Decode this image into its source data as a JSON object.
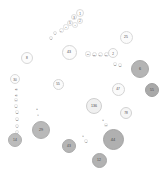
{
  "chart_data": {
    "type": "scatter",
    "title": "",
    "subtitle": "",
    "xlabel": "",
    "ylabel": "",
    "grid": false,
    "legend": null,
    "background": "#ffffff",
    "size_encoding": "circle radius encodes value",
    "color_encoding": "larger values are darker gray, smaller values near white",
    "palette": {
      "darkest": "#9a9a9a",
      "dark": "#a8a8a8",
      "mid": "#bdbdbd",
      "light": "#d6d6d6",
      "lightest": "#f2f2f2",
      "outline": "#cccccc",
      "text": "#4a4a4a"
    },
    "points": [
      {
        "label": "1",
        "x": 80,
        "y": 13,
        "r": 4.0,
        "fill": "#fdfdfd",
        "stroke": "#dcdcdc",
        "font": 3.0
      },
      {
        "label": "3",
        "x": 74,
        "y": 17,
        "r": 3.2,
        "fill": "#fdfdfd",
        "stroke": "#dedede",
        "font": 2.8
      },
      {
        "label": "2",
        "x": 80,
        "y": 21,
        "r": 3.0,
        "fill": "#fdfdfd",
        "stroke": "#dedede",
        "font": 2.6
      },
      {
        "label": "5",
        "x": 70,
        "y": 23,
        "r": 3.0,
        "fill": "#fdfdfd",
        "stroke": "#dedede",
        "font": 2.6
      },
      {
        "label": "4",
        "x": 75,
        "y": 25,
        "r": 2.8,
        "fill": "#fdfdfd",
        "stroke": "#e0e0e0",
        "font": 2.5
      },
      {
        "label": "7",
        "x": 66,
        "y": 27,
        "r": 2.6,
        "fill": "#fdfdfd",
        "stroke": "#e0e0e0",
        "font": 2.4
      },
      {
        "label": "6",
        "x": 61,
        "y": 30,
        "r": 2.5,
        "fill": "#fdfdfd",
        "stroke": "#e2e2e2",
        "font": 2.3
      },
      {
        "label": "9",
        "x": 55,
        "y": 33,
        "r": 2.4,
        "fill": "#fdfdfd",
        "stroke": "#e2e2e2",
        "font": 2.2
      },
      {
        "label": "8",
        "x": 51,
        "y": 38,
        "r": 2.4,
        "fill": "#fdfdfd",
        "stroke": "#e2e2e2",
        "font": 2.2
      },
      {
        "label": "25",
        "x": 126,
        "y": 37,
        "r": 6.5,
        "fill": "#fbfbfb",
        "stroke": "#d9d9d9",
        "font": 3.4
      },
      {
        "label": "43",
        "x": 69,
        "y": 52,
        "r": 7.5,
        "fill": "#fcfcfc",
        "stroke": "#d5d5d5",
        "font": 3.6
      },
      {
        "label": "16",
        "x": 88,
        "y": 54,
        "r": 2.6,
        "fill": "#fdfdfd",
        "stroke": "#e0e0e0",
        "font": 2.4
      },
      {
        "label": "12",
        "x": 94,
        "y": 54,
        "r": 2.5,
        "fill": "#fdfdfd",
        "stroke": "#e0e0e0",
        "font": 2.3
      },
      {
        "label": "14",
        "x": 100,
        "y": 54,
        "r": 2.5,
        "fill": "#fdfdfd",
        "stroke": "#e0e0e0",
        "font": 2.3
      },
      {
        "label": "17",
        "x": 106,
        "y": 54,
        "r": 2.5,
        "fill": "#fdfdfd",
        "stroke": "#e0e0e0",
        "font": 2.3
      },
      {
        "label": "2",
        "x": 113,
        "y": 53,
        "r": 5.0,
        "fill": "#fcfcfc",
        "stroke": "#d8d8d8",
        "font": 3.0
      },
      {
        "label": "8",
        "x": 27,
        "y": 58,
        "r": 6.0,
        "fill": "#fcfcfc",
        "stroke": "#d8d8d8",
        "font": 3.2
      },
      {
        "label": "11",
        "x": 115,
        "y": 64,
        "r": 1.8,
        "fill": "#fdfdfd",
        "stroke": "#e4e4e4",
        "font": 2.0
      },
      {
        "label": "13",
        "x": 120,
        "y": 65,
        "r": 1.8,
        "fill": "#fdfdfd",
        "stroke": "#e4e4e4",
        "font": 2.0
      },
      {
        "label": "6",
        "x": 140,
        "y": 69,
        "r": 9.0,
        "fill": "#b4b4b4",
        "stroke": "#a8a8a8",
        "font": 3.8
      },
      {
        "label": "30",
        "x": 15,
        "y": 79,
        "r": 5.0,
        "fill": "#fcfcfc",
        "stroke": "#dadada",
        "font": 3.0
      },
      {
        "label": "55",
        "x": 58,
        "y": 84,
        "r": 5.5,
        "fill": "#fbfbfb",
        "stroke": "#d6d6d6",
        "font": 3.1
      },
      {
        "label": "47",
        "x": 118,
        "y": 89,
        "r": 6.5,
        "fill": "#fafafa",
        "stroke": "#d4d4d4",
        "font": 3.3
      },
      {
        "label": "55",
        "x": 152,
        "y": 90,
        "r": 7.0,
        "fill": "#a9a9a9",
        "stroke": "#9f9f9f",
        "font": 3.4
      },
      {
        "label": "23",
        "x": 16,
        "y": 89,
        "r": 1.5,
        "fill": "#fdfdfd",
        "stroke": "#e6e6e6",
        "font": 1.9
      },
      {
        "label": "21",
        "x": 16,
        "y": 95,
        "r": 1.5,
        "fill": "#fdfdfd",
        "stroke": "#e6e6e6",
        "font": 1.9
      },
      {
        "label": "19",
        "x": 16,
        "y": 100,
        "r": 1.6,
        "fill": "#fdfdfd",
        "stroke": "#e6e6e6",
        "font": 1.9
      },
      {
        "label": "17",
        "x": 16,
        "y": 106,
        "r": 1.7,
        "fill": "#fdfdfd",
        "stroke": "#e5e5e5",
        "font": 2.0
      },
      {
        "label": "136",
        "x": 94,
        "y": 106,
        "r": 8.0,
        "fill": "#f0f0f0",
        "stroke": "#cfcfcf",
        "font": 3.6
      },
      {
        "label": "15",
        "x": 17,
        "y": 112,
        "r": 1.8,
        "fill": "#fdfdfd",
        "stroke": "#e5e5e5",
        "font": 2.0
      },
      {
        "label": "78",
        "x": 126,
        "y": 113,
        "r": 6.0,
        "fill": "#f6f6f6",
        "stroke": "#d2d2d2",
        "font": 3.2
      },
      {
        "label": "5",
        "x": 37,
        "y": 109,
        "r": 1.4,
        "fill": "#fdfdfd",
        "stroke": "#e6e6e6",
        "font": 1.8
      },
      {
        "label": "4",
        "x": 38,
        "y": 115,
        "r": 1.4,
        "fill": "#fdfdfd",
        "stroke": "#e6e6e6",
        "font": 1.8
      },
      {
        "label": "13",
        "x": 17,
        "y": 119,
        "r": 1.9,
        "fill": "#fdfdfd",
        "stroke": "#e4e4e4",
        "font": 2.0
      },
      {
        "label": "3",
        "x": 103,
        "y": 120,
        "r": 1.4,
        "fill": "#fdfdfd",
        "stroke": "#e6e6e6",
        "font": 1.8
      },
      {
        "label": "11",
        "x": 106,
        "y": 125,
        "r": 1.6,
        "fill": "#fdfdfd",
        "stroke": "#e5e5e5",
        "font": 1.9
      },
      {
        "label": "9",
        "x": 17,
        "y": 126,
        "r": 2.0,
        "fill": "#fdfdfd",
        "stroke": "#e3e3e3",
        "font": 2.1
      },
      {
        "label": "7",
        "x": 17,
        "y": 132,
        "r": 2.1,
        "fill": "#fdfdfd",
        "stroke": "#e3e3e3",
        "font": 2.1
      },
      {
        "label": "29",
        "x": 41,
        "y": 130,
        "r": 9.0,
        "fill": "#b9b9b9",
        "stroke": "#adadad",
        "font": 3.8
      },
      {
        "label": "44",
        "x": 113,
        "y": 139,
        "r": 10.5,
        "fill": "#b0b0b0",
        "stroke": "#a4a4a4",
        "font": 4.0
      },
      {
        "label": "1",
        "x": 83,
        "y": 136,
        "r": 1.4,
        "fill": "#fdfdfd",
        "stroke": "#e6e6e6",
        "font": 1.8
      },
      {
        "label": "41",
        "x": 86,
        "y": 141,
        "r": 1.8,
        "fill": "#fdfdfd",
        "stroke": "#e4e4e4",
        "font": 2.0
      },
      {
        "label": "14",
        "x": 15,
        "y": 140,
        "r": 7.0,
        "fill": "#bcbcbc",
        "stroke": "#b0b0b0",
        "font": 3.4
      },
      {
        "label": "43",
        "x": 69,
        "y": 146,
        "r": 7.0,
        "fill": "#b5b5b5",
        "stroke": "#a9a9a9",
        "font": 3.4
      },
      {
        "label": "12",
        "x": 99,
        "y": 160,
        "r": 7.5,
        "fill": "#b2b2b2",
        "stroke": "#a6a6a6",
        "font": 3.5
      }
    ]
  }
}
